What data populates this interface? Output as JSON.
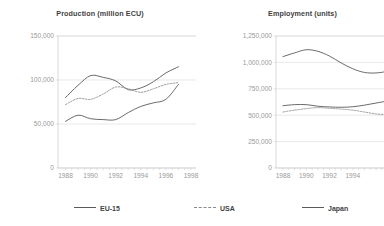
{
  "legend": {
    "items": [
      {
        "label": "EU-15",
        "style": "solid",
        "color": "#5a5a5a",
        "icon": "line-solid-icon"
      },
      {
        "label": "USA",
        "style": "dashed",
        "color": "#8a8a8a",
        "icon": "line-dashed-icon"
      },
      {
        "label": "Japan",
        "style": "solid",
        "color": "#5a5a5a",
        "icon": "line-solid-icon"
      }
    ]
  },
  "chart_data": [
    {
      "type": "line",
      "title": "Production (million ECU)",
      "xlabel": "",
      "ylabel": "",
      "x": [
        1988,
        1989,
        1990,
        1991,
        1992,
        1993,
        1994,
        1995,
        1996,
        1997
      ],
      "xticks": [
        "1988",
        "1990",
        "1992",
        "1994",
        "1996",
        "1998"
      ],
      "xtick_values": [
        1988,
        1990,
        1992,
        1994,
        1996,
        1998
      ],
      "xlim": [
        1987.4,
        1998.4
      ],
      "yticks": [
        "0",
        "50,000",
        "100,000",
        "150,000"
      ],
      "ytick_values": [
        0,
        50000,
        100000,
        150000
      ],
      "ylim": [
        0,
        150000
      ],
      "grid": true,
      "legend_position": "bottom",
      "series": [
        {
          "name": "EU-15",
          "style": "solid",
          "color": "#5a5a5a",
          "values": [
            80000,
            94000,
            105000,
            103000,
            99000,
            89000,
            91000,
            98000,
            108000,
            115000
          ]
        },
        {
          "name": "USA",
          "style": "dashed",
          "color": "#8a8a8a",
          "values": [
            72000,
            79000,
            78000,
            84000,
            92000,
            90000,
            86000,
            90000,
            95000,
            97000
          ]
        },
        {
          "name": "Japan",
          "style": "solid",
          "color": "#5a5a5a",
          "values": [
            53000,
            60000,
            56000,
            55000,
            55000,
            63000,
            70000,
            74000,
            78000,
            95000
          ]
        }
      ]
    },
    {
      "type": "line",
      "title": "Employment (units)",
      "xlabel": "",
      "ylabel": "",
      "x": [
        1988,
        1989,
        1990,
        1991,
        1992,
        1993,
        1994,
        1995,
        1996,
        1997
      ],
      "xticks": [
        "1988",
        "1990",
        "1992",
        "1994"
      ],
      "xtick_values": [
        1988,
        1990,
        1992,
        1994
      ],
      "xlim": [
        1987.4,
        1997.2
      ],
      "yticks": [
        "0",
        "250,000",
        "500,000",
        "750,000",
        "1,000,000",
        "1,250,000"
      ],
      "ytick_values": [
        0,
        250000,
        500000,
        750000,
        1000000,
        1250000
      ],
      "ylim": [
        0,
        1250000
      ],
      "grid": true,
      "legend_position": "bottom",
      "series": [
        {
          "name": "EU-15",
          "style": "solid",
          "color": "#5a5a5a",
          "values": [
            1055000,
            1090000,
            1120000,
            1105000,
            1060000,
            995000,
            940000,
            905000,
            900000,
            915000
          ]
        },
        {
          "name": "Japan",
          "style": "solid",
          "color": "#5a5a5a",
          "values": [
            590000,
            600000,
            600000,
            585000,
            578000,
            575000,
            580000,
            595000,
            615000,
            635000
          ]
        },
        {
          "name": "USA",
          "style": "dashed",
          "color": "#8a8a8a",
          "values": [
            530000,
            548000,
            562000,
            572000,
            565000,
            558000,
            548000,
            530000,
            512000,
            505000
          ]
        }
      ]
    }
  ]
}
